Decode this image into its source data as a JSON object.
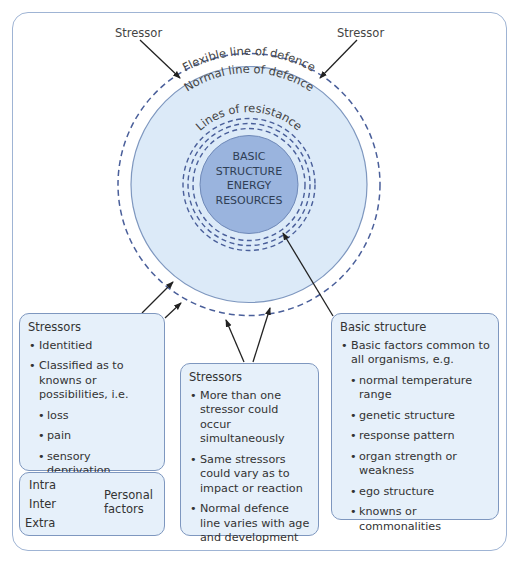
{
  "diagram": {
    "stressor_labels": [
      "Stressor",
      "Stressor"
    ],
    "rings": {
      "flexible": "Flexible line of defence",
      "normal": "Normal line of defence",
      "resistance": "Lines of resistance"
    },
    "core": [
      "BASIC",
      "STRUCTURE",
      "ENERGY",
      "RESOURCES"
    ],
    "colors": {
      "frame": "#9fb4d4",
      "box_fill": "#e6f0fa",
      "box_border": "#7e97bf",
      "normal_fill": "#dceaf8",
      "core_fill": "#9ab4de",
      "dash": "#4a5f9a",
      "arrow": "#222222"
    }
  },
  "boxes": {
    "stressors_left": {
      "title": "Stressors",
      "items": [
        "Identitied",
        "Classified as to knowns or possibilities, i.e."
      ],
      "subitems": [
        "loss",
        "pain",
        "sensory deprivation",
        "cultural change"
      ]
    },
    "personal_factors": {
      "items": [
        "Intra",
        "Inter",
        "Extra"
      ],
      "label": "Personal factors"
    },
    "stressors_middle": {
      "title": "Stressors",
      "items": [
        "More than one stressor could occur simultaneously",
        "Same stressors could vary as to impact or reaction",
        "Normal defence line varies with age and development"
      ]
    },
    "basic_structure": {
      "title": "Basic structure",
      "items": [
        "Basic factors common to all organisms, e.g."
      ],
      "subitems": [
        "normal temperature range",
        "genetic structure",
        "response pattern",
        "organ strength or weakness",
        "ego structure",
        "knowns or commonalities"
      ]
    }
  }
}
